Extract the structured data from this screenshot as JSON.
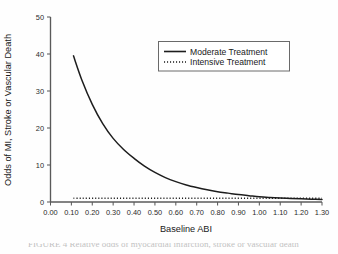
{
  "figure": {
    "background_color": "#ffffff",
    "line_color": "#1d1d1d",
    "axis_color": "#5a5a5a",
    "caption_fragment": "FIGURE 4 Relative odds of myocardial infarction, stroke or vascular death"
  },
  "chart_data": {
    "type": "line",
    "title": "",
    "xlabel": "Baseline ABI",
    "ylabel": "Odds of MI, Stroke or Vascular Death",
    "xlim": [
      0.0,
      1.3
    ],
    "ylim": [
      0,
      50
    ],
    "grid": false,
    "legend_position": "upper-right-inside",
    "xticks": [
      0.0,
      0.1,
      0.2,
      0.3,
      0.4,
      0.5,
      0.6,
      0.7,
      0.8,
      0.9,
      1.0,
      1.1,
      1.2,
      1.3
    ],
    "xtick_labels": [
      "0.00",
      "0.10",
      "0.20",
      "0.30",
      "0.40",
      "0.50",
      "0.60",
      "0.70",
      "0.80",
      "0.90",
      "1.00",
      "1.10",
      "1.20",
      "1.30"
    ],
    "yticks": [
      0,
      10,
      20,
      30,
      40,
      50
    ],
    "ytick_labels": [
      "0",
      "10",
      "20",
      "30",
      "40",
      "50"
    ],
    "x": [
      0.11,
      0.15,
      0.2,
      0.25,
      0.3,
      0.35,
      0.4,
      0.45,
      0.5,
      0.55,
      0.6,
      0.65,
      0.7,
      0.75,
      0.8,
      0.85,
      0.9,
      0.95,
      1.0,
      1.05,
      1.1,
      1.15,
      1.2,
      1.25,
      1.3
    ],
    "series": [
      {
        "name": "Moderate Treatment",
        "style": "solid",
        "values": [
          39.5,
          33.0,
          26.4,
          21.2,
          17.2,
          14.2,
          11.8,
          9.7,
          8.0,
          6.6,
          5.5,
          4.6,
          3.9,
          3.3,
          2.8,
          2.4,
          2.0,
          1.7,
          1.4,
          1.2,
          1.05,
          0.95,
          0.85,
          0.75,
          0.65
        ]
      },
      {
        "name": "Intensive Treatment",
        "style": "dotted",
        "values": [
          1.0,
          1.0,
          1.0,
          1.0,
          1.0,
          1.0,
          1.0,
          1.0,
          1.0,
          1.0,
          1.0,
          1.0,
          1.0,
          1.0,
          1.0,
          1.0,
          1.0,
          1.0,
          1.0,
          1.0,
          1.0,
          1.0,
          1.0,
          1.0,
          1.0
        ]
      }
    ]
  },
  "legend": {
    "entries": [
      {
        "label": "Moderate Treatment",
        "style": "solid"
      },
      {
        "label": "Intensive Treatment",
        "style": "dotted"
      }
    ]
  }
}
